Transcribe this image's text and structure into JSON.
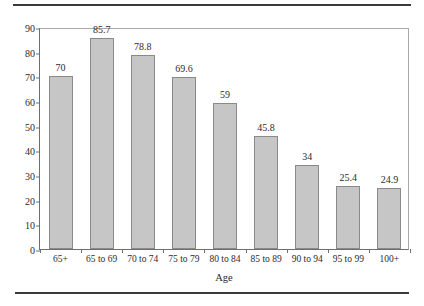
{
  "figure": {
    "rule_top": "horizontal-rule",
    "rule_bottom": "horizontal-rule",
    "caption_fragment": ""
  },
  "chart_data": {
    "type": "bar",
    "title": "",
    "xlabel": "Age",
    "ylabel": "",
    "categories": [
      "65+",
      "65 to 69",
      "70 to 74",
      "75 to 79",
      "80 to 84",
      "85 to 89",
      "90 to 94",
      "95 to 99",
      "100+"
    ],
    "values": [
      70,
      85.7,
      78.8,
      69.6,
      59,
      45.8,
      34,
      25.4,
      24.9
    ],
    "value_labels": [
      "70",
      "85.7",
      "78.8",
      "69.6",
      "59",
      "45.8",
      "34",
      "25.4",
      "24.9"
    ],
    "ylim": [
      0,
      90
    ],
    "yticks": [
      0,
      10,
      20,
      30,
      40,
      50,
      60,
      70,
      80,
      90
    ],
    "ytick_labels": [
      "0",
      "10",
      "20",
      "30",
      "40",
      "50",
      "60",
      "70",
      "80",
      "90"
    ],
    "grid": false,
    "legend": null,
    "bar_color": "#c6c6c6",
    "bar_edge_color": "#8a8a8a",
    "axis_color": "#6e6e6e"
  }
}
